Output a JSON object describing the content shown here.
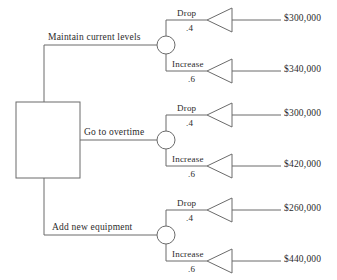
{
  "diagram": {
    "type": "decision-tree",
    "line_color": "#6b6b6b",
    "text_color": "#2b2b2b"
  },
  "root": {
    "node_type": "decision-square"
  },
  "branches": [
    {
      "label": "Maintain current levels",
      "outcomes": [
        {
          "label": "Drop",
          "probability": ".4",
          "payoff": "$300,000"
        },
        {
          "label": "Increase",
          "probability": ".6",
          "payoff": "$340,000"
        }
      ]
    },
    {
      "label": "Go to overtime",
      "outcomes": [
        {
          "label": "Drop",
          "probability": ".4",
          "payoff": "$300,000"
        },
        {
          "label": "Increase",
          "probability": ".6",
          "payoff": "$420,000"
        }
      ]
    },
    {
      "label": "Add  new equipment",
      "outcomes": [
        {
          "label": "Drop",
          "probability": ".4",
          "payoff": "$260,000"
        },
        {
          "label": "Increase",
          "probability": ".6",
          "payoff": "$440,000"
        }
      ]
    }
  ]
}
